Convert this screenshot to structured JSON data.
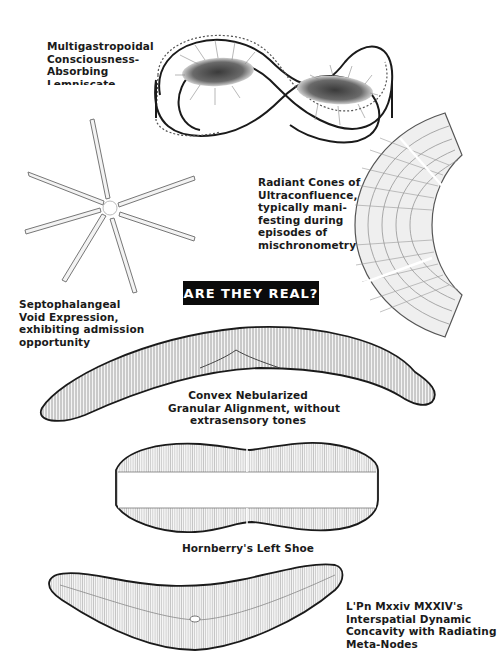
{
  "banner": {
    "title": "ARE THEY REAL?",
    "background": "#0b0b0b",
    "color": "#ffffff"
  },
  "specimens": [
    {
      "id": "infinity",
      "figure": "infinity-loop-diatom",
      "caption_lines": [
        "Multigastropoidal",
        "Consciousness-",
        "Absorbing",
        "Lemniscate"
      ]
    },
    {
      "id": "star",
      "figure": "star-radial-diatom",
      "caption_lines": [
        "Septophalangeal",
        "Void Expression,",
        "exhibiting admission",
        "opportunity"
      ]
    },
    {
      "id": "fan",
      "figure": "fan-segmented-diatom",
      "caption_lines": [
        "Radiant Cones of",
        "Ultraconfluence,",
        "typically mani-",
        "festing during",
        "episodes of",
        "mischronometry"
      ]
    },
    {
      "id": "crescent",
      "figure": "crescent-striated-diatom",
      "caption_lines": [
        "Convex Nebularized",
        "Granular Alignment, without",
        "extrasensory tones"
      ]
    },
    {
      "id": "shoe",
      "figure": "shoe-shaped-diatom",
      "caption_lines": [
        "Hornberry's Left Shoe"
      ]
    },
    {
      "id": "boomerang",
      "figure": "boomerang-diatom",
      "caption_lines": [
        "L'Pn Mxxiv MXXIV's",
        "Interspatial Dynamic",
        "Concavity with Radiating",
        "Meta-Nodes"
      ]
    }
  ],
  "colors": {
    "ink": "#1a1a1a",
    "shade": "#555555",
    "paper": "#ffffff"
  }
}
